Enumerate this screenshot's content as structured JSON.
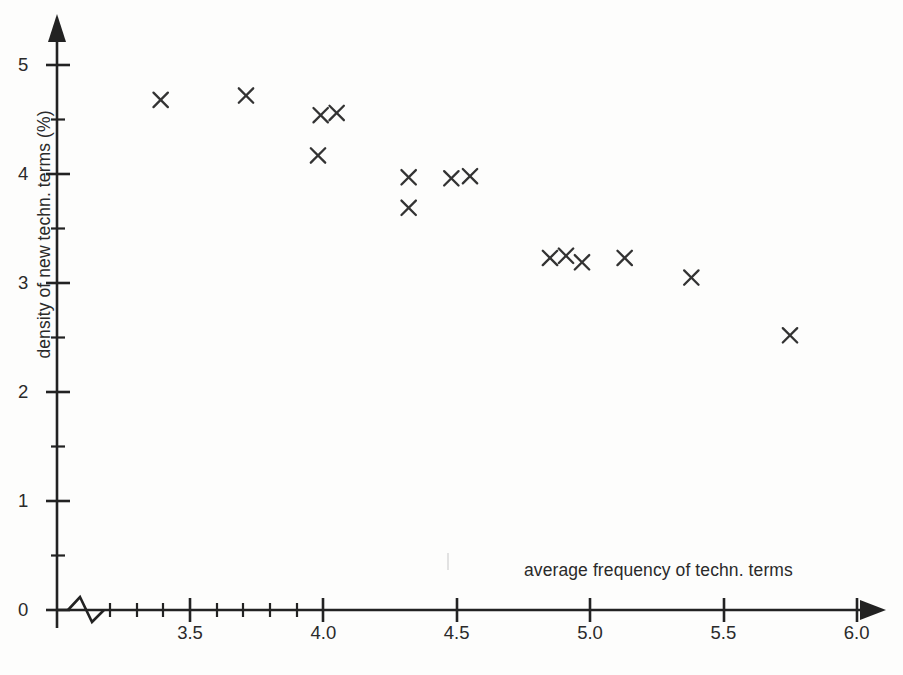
{
  "chart_data": {
    "type": "scatter",
    "title": "",
    "xlabel": "average frequency of techn. terms",
    "ylabel": "density of new techn. terms (%)",
    "xlim": [
      3.05,
      6.0
    ],
    "ylim": [
      0,
      5.4
    ],
    "grid": false,
    "legend": "none",
    "axis_break": true,
    "marker": "x",
    "marker_color": "#333333",
    "xticks": [
      3.5,
      4.0,
      4.5,
      5.0,
      5.5,
      6.0
    ],
    "xtick_labels": [
      "3.5",
      "4.0",
      "4.5",
      "5.0",
      "5.5",
      "6.0"
    ],
    "xminor_ticks": [
      3.2,
      3.3,
      3.4,
      3.6,
      3.7,
      3.8,
      3.9
    ],
    "yticks": [
      0,
      1,
      2,
      3,
      4,
      5
    ],
    "ytick_labels": [
      "0",
      "1",
      "2",
      "3",
      "4",
      "5"
    ],
    "yminor_ticks": [
      0.5,
      1.5,
      2.5,
      3.5,
      4.5
    ],
    "points": [
      {
        "x": 3.39,
        "y": 4.68
      },
      {
        "x": 3.71,
        "y": 4.72
      },
      {
        "x": 3.98,
        "y": 4.17
      },
      {
        "x": 3.99,
        "y": 4.54
      },
      {
        "x": 4.05,
        "y": 4.56
      },
      {
        "x": 4.32,
        "y": 3.97
      },
      {
        "x": 4.32,
        "y": 3.69
      },
      {
        "x": 4.48,
        "y": 3.96
      },
      {
        "x": 4.55,
        "y": 3.98
      },
      {
        "x": 4.85,
        "y": 3.23
      },
      {
        "x": 4.91,
        "y": 3.25
      },
      {
        "x": 4.97,
        "y": 3.19
      },
      {
        "x": 5.13,
        "y": 3.23
      },
      {
        "x": 5.38,
        "y": 3.05
      },
      {
        "x": 5.75,
        "y": 2.52
      }
    ]
  }
}
